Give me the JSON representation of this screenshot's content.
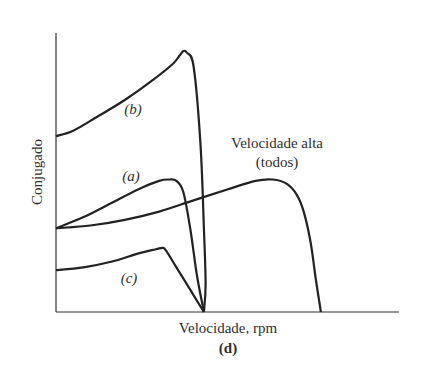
{
  "chart_data": {
    "type": "line",
    "title": "",
    "panel_label": "(d)",
    "xlabel": "Velocidade, rpm",
    "ylabel": "Conjugado",
    "xlim": [
      0,
      1
    ],
    "ylim": [
      0,
      1
    ],
    "grid": false,
    "legend": "none",
    "series": [
      {
        "name": "(b)",
        "label": "(b)",
        "x": [
          0,
          0.05,
          0.12,
          0.2,
          0.28,
          0.34,
          0.36,
          0.37,
          0.38,
          0.4,
          0.42,
          0.43,
          0.435,
          0.43
        ],
        "y": [
          0.63,
          0.65,
          0.7,
          0.76,
          0.83,
          0.89,
          0.92,
          0.935,
          0.93,
          0.88,
          0.6,
          0.3,
          0.1,
          0.0
        ]
      },
      {
        "name": "(a)",
        "label": "(a)",
        "x": [
          0,
          0.08,
          0.16,
          0.24,
          0.3,
          0.33,
          0.35,
          0.37,
          0.39,
          0.41,
          0.43
        ],
        "y": [
          0.3,
          0.34,
          0.39,
          0.44,
          0.47,
          0.475,
          0.47,
          0.43,
          0.3,
          0.13,
          0.0
        ]
      },
      {
        "name": "(c)",
        "label": "(c)",
        "x": [
          0,
          0.08,
          0.16,
          0.24,
          0.29,
          0.31,
          0.32,
          0.35,
          0.39,
          0.43
        ],
        "y": [
          0.15,
          0.16,
          0.18,
          0.21,
          0.225,
          0.23,
          0.22,
          0.16,
          0.08,
          0.0
        ]
      },
      {
        "name": "Velocidade alta (todos)",
        "label": "Velocidade alta\n(todos)",
        "x": [
          0,
          0.1,
          0.2,
          0.3,
          0.4,
          0.5,
          0.58,
          0.63,
          0.67,
          0.7,
          0.72,
          0.74,
          0.755,
          0.77
        ],
        "y": [
          0.3,
          0.31,
          0.33,
          0.36,
          0.4,
          0.44,
          0.47,
          0.475,
          0.46,
          0.42,
          0.36,
          0.25,
          0.12,
          0.0
        ]
      }
    ],
    "annotations": [
      "(b)",
      "(a)",
      "(c)",
      "Velocidade alta",
      "(todos)"
    ]
  }
}
